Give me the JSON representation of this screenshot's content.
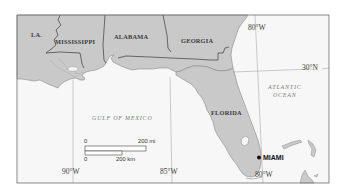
{
  "map": {
    "title": "",
    "states": [
      {
        "id": "la",
        "label": "LA."
      },
      {
        "id": "mississippi",
        "label": "MISSISSIPPI"
      },
      {
        "id": "alabama",
        "label": "ALABAMA"
      },
      {
        "id": "georgia",
        "label": "GEORGIA"
      },
      {
        "id": "florida",
        "label": "FLORIDA"
      }
    ],
    "water_bodies": [
      {
        "id": "gulf",
        "label": "GULF OF MEXICO"
      },
      {
        "id": "atlantic",
        "line1": "ATLANTIC",
        "line2": "OCEAN"
      }
    ],
    "cities": [
      {
        "id": "miami",
        "label": "MIAMI"
      }
    ],
    "graticule": {
      "lon_90": "90°W",
      "lon_85": "85°W",
      "lon_80_top": "80°W",
      "lon_80_bottom": "80°W",
      "lat_30": "30°N"
    },
    "scale_bar": {
      "mi_zero": "0",
      "mi_label": "200 mi",
      "km_zero": "0",
      "km_label": "200 km"
    },
    "colors": {
      "land": "#c9c9c9",
      "water": "#f7f7f7",
      "border": "#3a3a3a",
      "coast": "#8a8a8a",
      "frame": "#6e6e6e"
    }
  }
}
